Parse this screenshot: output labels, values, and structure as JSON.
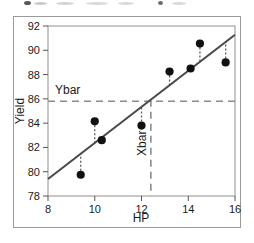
{
  "figure": {
    "background_color": "#ffffff",
    "frame_color": "#9a9a9a"
  },
  "chart_data": {
    "type": "scatter",
    "title": "",
    "xlabel": "HP",
    "ylabel": "Yield",
    "xlim": [
      8,
      16
    ],
    "ylim": [
      78,
      92
    ],
    "xticks": [
      8,
      10,
      12,
      14,
      16
    ],
    "yticks": [
      78,
      80,
      82,
      84,
      86,
      88,
      90,
      92
    ],
    "xtick_labels": [
      "8",
      "10",
      "12",
      "14",
      "16"
    ],
    "ytick_labels": [
      "78",
      "80",
      "82",
      "84",
      "86",
      "88",
      "90",
      "92"
    ],
    "grid": false,
    "legend": null,
    "legend_position": "none",
    "point_color": "#111111",
    "line_color": "#4a4a4a",
    "residual_color": "#5a5a5a",
    "reference_line_color": "#8c8c8c",
    "x": [
      9.4,
      10.0,
      10.3,
      12.0,
      13.2,
      14.1,
      14.5,
      15.6
    ],
    "y": [
      79.75,
      84.15,
      82.6,
      83.8,
      88.25,
      88.5,
      90.55,
      89.0
    ],
    "points": [
      {
        "x": 9.4,
        "y": 79.75,
        "fitted": 81.45
      },
      {
        "x": 10.0,
        "y": 84.15,
        "fitted": 82.35
      },
      {
        "x": 10.3,
        "y": 82.6,
        "fitted": 82.8
      },
      {
        "x": 12.0,
        "y": 83.8,
        "fitted": 85.33
      },
      {
        "x": 13.2,
        "y": 88.25,
        "fitted": 87.11
      },
      {
        "x": 14.1,
        "y": 88.5,
        "fitted": 88.45
      },
      {
        "x": 14.5,
        "y": 90.55,
        "fitted": 89.04
      },
      {
        "x": 15.6,
        "y": 89.0,
        "fitted": 90.68
      }
    ],
    "regression_line": {
      "label": "fitted regression line",
      "x_start": 8,
      "y_start": 79.4,
      "x_end": 16,
      "y_end": 91.28,
      "slope": 1.485,
      "intercept": 67.52
    },
    "reference_lines": [
      {
        "name": "ybar",
        "label": "Ybar",
        "orientation": "horizontal",
        "value": 85.8,
        "style": "dashed"
      },
      {
        "name": "xbar",
        "label": "Xbar",
        "orientation": "vertical",
        "value": 12.4,
        "style": "dashed"
      }
    ],
    "residual_style": "dotted",
    "annotations": [
      {
        "name": "ybar-label",
        "text": "Ybar",
        "x": 8.3,
        "y": 86.4
      },
      {
        "name": "xbar-label",
        "text": "Xbar",
        "x": 12.2,
        "y": 81.3,
        "rotation": -90
      }
    ]
  }
}
